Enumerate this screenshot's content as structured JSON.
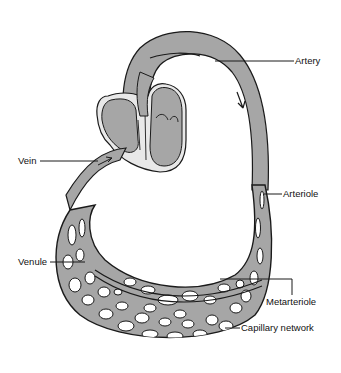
{
  "diagram": {
    "type": "circulatory-system-schematic",
    "colors": {
      "vessel_fill": "#a6a6a6",
      "outline": "#1a1a1a",
      "background": "#ffffff",
      "chamber_lining": "#e8e8e8"
    },
    "labels": {
      "artery": "Artery",
      "vein": "Vein",
      "arteriole": "Arteriole",
      "venule": "Venule",
      "metarteriole": "Metarteriole",
      "capillary_network": "Capillary network"
    }
  }
}
